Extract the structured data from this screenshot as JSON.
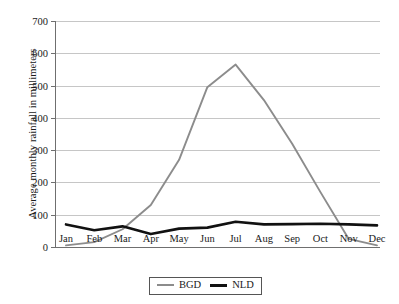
{
  "chart_data": {
    "type": "line",
    "title": "",
    "xlabel": "",
    "ylabel": "Average monthly rainfall in millimeters",
    "categories": [
      "Jan",
      "Feb",
      "Mar",
      "Apr",
      "May",
      "Jun",
      "Jul",
      "Aug",
      "Sep",
      "Oct",
      "Nov",
      "Dec"
    ],
    "ylim": [
      0,
      700
    ],
    "yticks": [
      0,
      100,
      200,
      300,
      400,
      500,
      600,
      700
    ],
    "grid": true,
    "legend_position": "bottom-center",
    "series": [
      {
        "name": "BGD",
        "color": "#8c8c8c",
        "values": [
          5,
          15,
          55,
          130,
          270,
          495,
          565,
          455,
          320,
          170,
          25,
          5
        ]
      },
      {
        "name": "NLD",
        "color": "#111111",
        "values": [
          70,
          52,
          64,
          40,
          57,
          60,
          78,
          70,
          71,
          72,
          70,
          67
        ]
      }
    ]
  },
  "legend": {
    "items": [
      {
        "label": "BGD",
        "swatch": "gray-line-swatch"
      },
      {
        "label": "NLD",
        "swatch": "black-line-swatch"
      }
    ]
  }
}
